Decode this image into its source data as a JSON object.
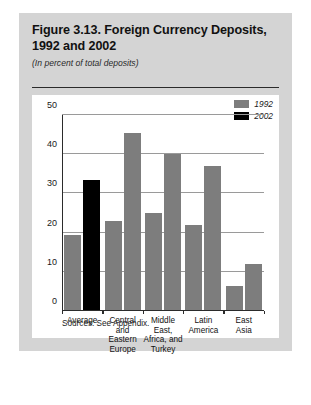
{
  "figure": {
    "title": "Figure 3.13. Foreign Currency Deposits, 1992 and 2002",
    "subtitle": "(In percent of total deposits)",
    "source": "Sources: See Appendix."
  },
  "colors": {
    "panel_background": "#d4d4d4",
    "card_background": "#ffffff",
    "series_1992": "#7d7d7d",
    "series_1992_average": "#3a3a3a",
    "series_2002": "#000000",
    "gridline": "#9a9a9a",
    "axis": "#2b2b2b",
    "text": "#111111"
  },
  "chart_data": {
    "type": "bar",
    "title": "Figure 3.13. Foreign Currency Deposits, 1992 and 2002",
    "subtitle": "(In percent of total deposits)",
    "xlabel": "",
    "ylabel": "",
    "ylim": [
      0,
      50
    ],
    "yticks": [
      0,
      10,
      20,
      30,
      40,
      50
    ],
    "ytick_labels": [
      "0",
      "10",
      "20",
      "30",
      "40",
      "50"
    ],
    "grid": true,
    "legend_position": "top-right",
    "categories": [
      "Average",
      "Central\nand\nEastern\nEurope",
      "Middle\nEast,\nAfrica, and\nTurkey",
      "Latin\nAmerica",
      "East\nAsia"
    ],
    "series": [
      {
        "name": "1992",
        "values": [
          19.5,
          23.0,
          25.0,
          22.0,
          6.5
        ]
      },
      {
        "name": "2002",
        "values": [
          33.5,
          45.5,
          40.0,
          37.0,
          12.0
        ]
      }
    ]
  }
}
